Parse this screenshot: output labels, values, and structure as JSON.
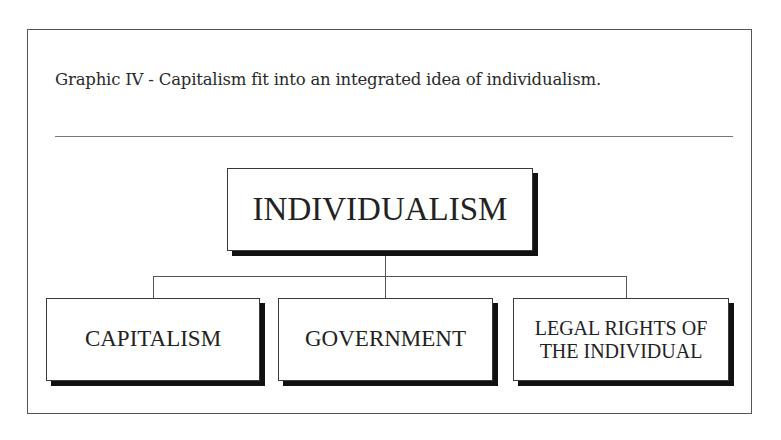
{
  "caption": "Graphic IV - Capitalism fit into an integrated idea of individualism.",
  "diagram": {
    "type": "hierarchy",
    "root": {
      "label": "INDIVIDUALISM"
    },
    "children": [
      {
        "label": "CAPITALISM"
      },
      {
        "label": "GOVERNMENT"
      },
      {
        "label_line1": "LEGAL RIGHTS OF",
        "label_line2": "THE INDIVIDUAL"
      }
    ],
    "colors": {
      "border": "#3a3a3a",
      "shadow": "#111111",
      "text": "#222222",
      "connector": "#555555"
    }
  }
}
